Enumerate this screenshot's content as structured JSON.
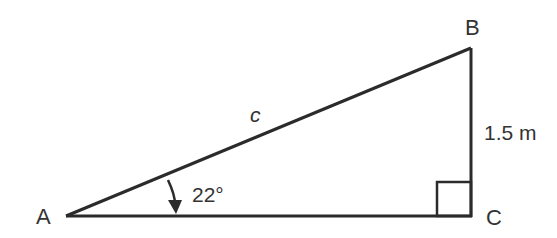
{
  "diagram": {
    "type": "right-triangle",
    "stroke_color": "#2b2b2b",
    "vertices": {
      "A": {
        "label": "A"
      },
      "B": {
        "label": "B"
      },
      "C": {
        "label": "C"
      }
    },
    "sides": {
      "hypotenuse": {
        "label": "c"
      },
      "opposite": {
        "label": "1.5 m"
      }
    },
    "angle_A": {
      "label": "22°"
    },
    "right_angle_at": "C"
  }
}
